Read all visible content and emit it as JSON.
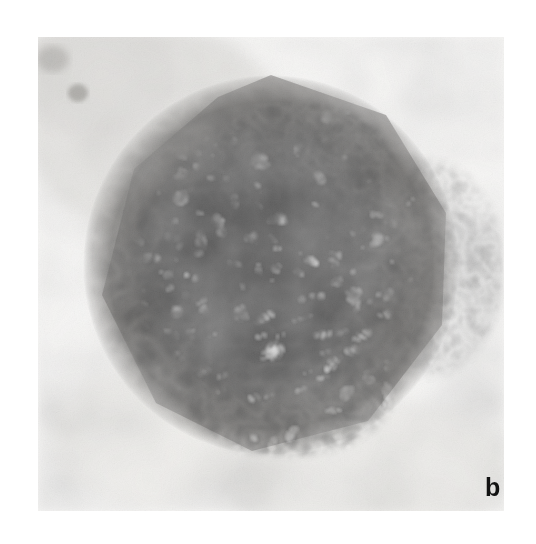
{
  "figure": {
    "panel_label": "b",
    "media_type": "electron-micrograph",
    "color_mode": "grayscale",
    "frame": {
      "x": 38,
      "y": 37,
      "width": 466,
      "height": 474
    },
    "page_background": "#ffffff",
    "plate_background": "#f1f0ee",
    "tones": {
      "paper_white": "#ffffff",
      "plate_light": "#f3f2f0",
      "halo_gray": "#d9d7d3",
      "envelope_gray": "#b3b0aa",
      "capsid_mid": "#6e6b66",
      "capsid_dark": "#262421",
      "core_black": "#0c0b0a",
      "capsomere_light": "#eceae5",
      "label_ink": "#121212"
    },
    "particle": {
      "center_x": 233,
      "center_y": 228,
      "outer_radius": 185,
      "core_radius": 128,
      "outline": "faceted-polygonal",
      "capsomere_count_visible": 196
    },
    "artifacts": [
      {
        "name": "dark-speck-upper-left",
        "x": 40,
        "y": 55,
        "r": 9
      },
      {
        "name": "gray-smudge-upper-left",
        "x": 18,
        "y": 20,
        "r": 52
      },
      {
        "name": "envelope-tail-right",
        "x": 400,
        "y": 230,
        "r": 70
      }
    ]
  }
}
